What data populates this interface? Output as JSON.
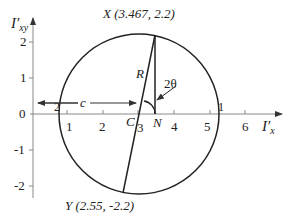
{
  "diagram": {
    "type": "mohr-circle",
    "y_axis_label": "I′",
    "y_axis_sub": "xy",
    "x_axis_label": "I′",
    "x_axis_sub": "x",
    "x_ticks": [
      "1",
      "2",
      "3",
      "4",
      "5",
      "6"
    ],
    "y_ticks": [
      "2",
      "1",
      "0",
      "-1",
      "-2"
    ],
    "point_x_label": "X (3.467, 2.2)",
    "point_y_label": "Y (2.55, -2.2)",
    "radius_label": "R",
    "angle_label": "2θ",
    "center_label": "C",
    "n_label": "N",
    "c_label": "c",
    "intersect_1": "1",
    "intersect_2": "2",
    "colors": {
      "line": "#222222",
      "axis": "#888888"
    }
  }
}
